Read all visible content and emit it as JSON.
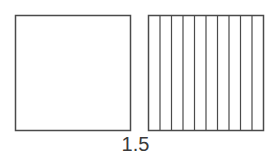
{
  "diagram": {
    "caption": "1.5",
    "whole_square": {
      "x": 15,
      "y": 15,
      "size": 115,
      "divisions": 0
    },
    "tenths_square": {
      "x": 148,
      "y": 15,
      "size": 115,
      "divisions": 10
    },
    "stroke_color": "#4a4a4a",
    "background": "#ffffff"
  }
}
